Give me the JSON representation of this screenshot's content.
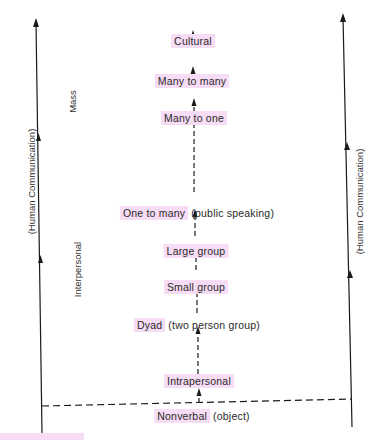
{
  "diagram": {
    "type": "hierarchy-of-communication",
    "side_label_left": "(Human Communication)",
    "side_label_right": "(Human Communication)",
    "category_labels": {
      "mass": "Mass",
      "interpersonal": "Interpersonal"
    },
    "levels": [
      {
        "label": "Cultural",
        "highlighted": true
      },
      {
        "label": "Many to many",
        "highlighted": true
      },
      {
        "label": "Many to one",
        "highlighted": true
      },
      {
        "label": "One to many",
        "suffix": " (public speaking)",
        "highlighted": true
      },
      {
        "label": "Large group",
        "highlighted": true
      },
      {
        "label": "Small group",
        "highlighted": true
      },
      {
        "label": "Dyad",
        "suffix": " (two person group)",
        "highlighted": true
      },
      {
        "label": "Intrapersonal",
        "highlighted": true
      },
      {
        "label": "Nonverbal",
        "suffix": " (object)",
        "highlighted": true
      }
    ],
    "colors": {
      "highlight": "#f6dcf4",
      "line": "#1a1a1a",
      "text": "#2a2a2a"
    }
  }
}
